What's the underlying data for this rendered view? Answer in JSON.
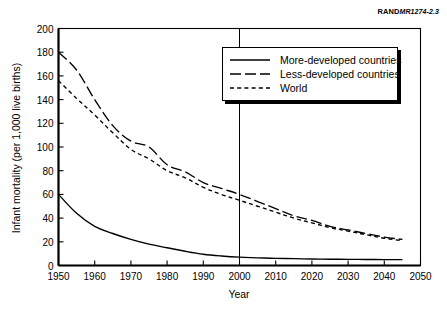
{
  "figure": {
    "source_label": {
      "brand": "RAND",
      "document_number": "MR1274-2.3"
    }
  },
  "legend": {
    "entries": [
      {
        "label": "More-developed countries",
        "style": "solid"
      },
      {
        "label": "Less-developed countries",
        "style": "long-dash"
      },
      {
        "label": "World",
        "style": "short-dash"
      }
    ]
  },
  "chart_data": {
    "type": "line",
    "title": "",
    "xlabel": "Year",
    "ylabel": "Infant mortality (per 1,000 live births)",
    "xlim": [
      1950,
      2050
    ],
    "ylim": [
      0,
      200
    ],
    "xticks": [
      1950,
      1960,
      1970,
      1980,
      1990,
      2000,
      2010,
      2020,
      2030,
      2040,
      2050
    ],
    "yticks": [
      0,
      20,
      40,
      60,
      80,
      100,
      120,
      140,
      160,
      180,
      200
    ],
    "xtick_labels": [
      "1950",
      "1960",
      "1970",
      "1980",
      "1990",
      "2000",
      "2010",
      "2020",
      "2030",
      "2040",
      "2050"
    ],
    "ytick_labels": [
      "0",
      "20",
      "40",
      "60",
      "80",
      "100",
      "120",
      "140",
      "160",
      "180",
      "200"
    ],
    "grid": false,
    "legend_position": "upper-right",
    "annotations": [
      {
        "type": "vertical-line",
        "x": 2000,
        "label": ""
      }
    ],
    "x": [
      1950,
      1955,
      1960,
      1965,
      1970,
      1975,
      1980,
      1985,
      1990,
      1995,
      2000,
      2005,
      2010,
      2015,
      2020,
      2025,
      2030,
      2035,
      2040,
      2045
    ],
    "series": [
      {
        "name": "More-developed countries",
        "style": "solid",
        "values": [
          60,
          44,
          33,
          27,
          22,
          18,
          15,
          12,
          9.5,
          8,
          7,
          6.5,
          6,
          5.8,
          5.5,
          5.3,
          5.2,
          5.1,
          5.0,
          5.0
        ]
      },
      {
        "name": "Less-developed countries",
        "style": "long-dash",
        "values": [
          180,
          165,
          140,
          118,
          105,
          100,
          85,
          79,
          70,
          65,
          60,
          54,
          48,
          42,
          38,
          33,
          30,
          27,
          24,
          22
        ]
      },
      {
        "name": "World",
        "style": "short-dash",
        "values": [
          156,
          141,
          127,
          112,
          98,
          90,
          80,
          74,
          66,
          60,
          55,
          50,
          45,
          40,
          36,
          32,
          29,
          26,
          23,
          21
        ]
      }
    ]
  }
}
